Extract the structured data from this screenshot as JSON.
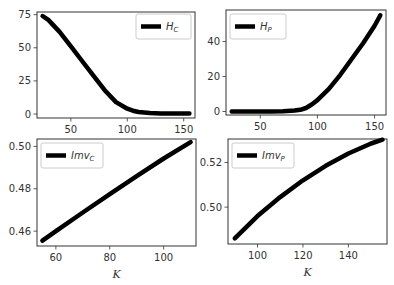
{
  "chart_data": [
    {
      "type": "line",
      "panel": "top-left",
      "legend": {
        "label": "H",
        "subscript": "C",
        "position": "upper right"
      },
      "xlabel": "",
      "ylabel": "",
      "xticks": [
        50,
        100,
        150
      ],
      "yticks": [
        0,
        25,
        50,
        75
      ],
      "xlim": [
        20,
        160
      ],
      "ylim": [
        -3,
        77
      ],
      "series": [
        {
          "name": "H_C",
          "x": [
            25,
            30,
            40,
            50,
            60,
            70,
            80,
            90,
            100,
            105,
            110,
            120,
            130,
            140,
            150,
            155
          ],
          "y": [
            74,
            71,
            62,
            51,
            40,
            29,
            18,
            9,
            4,
            2.5,
            1.5,
            0.8,
            0.5,
            0.4,
            0.4,
            0.4
          ]
        }
      ]
    },
    {
      "type": "line",
      "panel": "top-right",
      "legend": {
        "label": "H",
        "subscript": "P",
        "position": "upper left"
      },
      "xlabel": "",
      "ylabel": "",
      "xticks": [
        50,
        100,
        150
      ],
      "yticks": [
        0,
        20,
        40
      ],
      "xlim": [
        20,
        160
      ],
      "ylim": [
        -2,
        58
      ],
      "series": [
        {
          "name": "H_P",
          "x": [
            25,
            40,
            60,
            70,
            80,
            85,
            90,
            95,
            100,
            110,
            120,
            130,
            140,
            150,
            155
          ],
          "y": [
            0,
            0,
            0,
            0.1,
            0.5,
            1,
            2,
            4,
            6.5,
            13,
            21,
            30,
            39,
            49,
            55
          ]
        }
      ]
    },
    {
      "type": "line",
      "panel": "bottom-left",
      "legend": {
        "label": "Imv",
        "subscript": "C",
        "position": "upper left"
      },
      "xlabel": "K",
      "ylabel": "",
      "xticks": [
        60,
        80,
        100
      ],
      "yticks": [
        0.46,
        0.48,
        0.5
      ],
      "xlim": [
        53,
        112
      ],
      "ylim": [
        0.453,
        0.5035
      ],
      "series": [
        {
          "name": "Imv_C",
          "x": [
            55,
            60,
            70,
            80,
            90,
            100,
            110
          ],
          "y": [
            0.4555,
            0.46,
            0.4688,
            0.4775,
            0.486,
            0.4943,
            0.502
          ]
        }
      ]
    },
    {
      "type": "line",
      "panel": "bottom-right",
      "legend": {
        "label": "Imv",
        "subscript": "P",
        "position": "upper left"
      },
      "xlabel": "K",
      "ylabel": "",
      "xticks": [
        100,
        120,
        140
      ],
      "yticks": [
        0.5,
        0.52
      ],
      "xlim": [
        87,
        157
      ],
      "ylim": [
        0.4835,
        0.5305
      ],
      "series": [
        {
          "name": "Imv_P",
          "x": [
            90,
            100,
            110,
            120,
            130,
            140,
            150,
            155
          ],
          "y": [
            0.486,
            0.496,
            0.5045,
            0.512,
            0.5185,
            0.524,
            0.5285,
            0.5302
          ]
        }
      ]
    }
  ],
  "panels": [
    {
      "box": [
        37,
        12,
        158,
        106
      ],
      "legend_box": [
        136,
        14,
        55,
        25
      ],
      "legend_side": "right"
    },
    {
      "box": [
        226,
        10,
        160,
        105
      ],
      "legend_box": [
        230,
        14,
        56,
        25
      ],
      "legend_side": "left"
    },
    {
      "box": [
        37,
        139,
        159,
        107
      ],
      "legend_box": [
        41,
        143,
        62,
        25
      ],
      "legend_side": "left"
    },
    {
      "box": [
        228,
        139,
        159,
        105
      ],
      "legend_box": [
        232,
        143,
        62,
        25
      ],
      "legend_side": "left"
    }
  ],
  "colors": {
    "line": "#000000",
    "axes": "#333333",
    "legend_border": "#cccccc",
    "background": "#ffffff"
  }
}
